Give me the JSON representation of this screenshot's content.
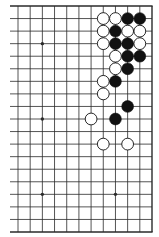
{
  "diagram": {
    "type": "go-board-fragment",
    "columns": 12,
    "rows": 19,
    "open_edges": [
      "left"
    ],
    "colors": {
      "line": "#2a2a2a",
      "black_stone": "#111111",
      "white_stone": "#ffffff",
      "background": "#ffffff"
    },
    "star_points": [
      {
        "col": 2,
        "row": 3
      },
      {
        "col": 2,
        "row": 9
      },
      {
        "col": 2,
        "row": 15
      },
      {
        "col": 8,
        "row": 15
      }
    ],
    "stones": [
      {
        "color": "white",
        "col": 7,
        "row": 1
      },
      {
        "color": "white",
        "col": 8,
        "row": 1
      },
      {
        "color": "black",
        "col": 9,
        "row": 1
      },
      {
        "color": "black",
        "col": 10,
        "row": 1
      },
      {
        "color": "white",
        "col": 7,
        "row": 2
      },
      {
        "color": "black",
        "col": 8,
        "row": 2
      },
      {
        "color": "white",
        "col": 9,
        "row": 2
      },
      {
        "color": "white",
        "col": 10,
        "row": 2
      },
      {
        "color": "white",
        "col": 7,
        "row": 3
      },
      {
        "color": "black",
        "col": 8,
        "row": 3
      },
      {
        "color": "black",
        "col": 9,
        "row": 3
      },
      {
        "color": "white",
        "col": 10,
        "row": 3
      },
      {
        "color": "white",
        "col": 8,
        "row": 4
      },
      {
        "color": "black",
        "col": 9,
        "row": 4
      },
      {
        "color": "black",
        "col": 10,
        "row": 4
      },
      {
        "color": "white",
        "col": 8,
        "row": 5
      },
      {
        "color": "black",
        "col": 9,
        "row": 5
      },
      {
        "color": "white",
        "col": 7,
        "row": 6
      },
      {
        "color": "black",
        "col": 8,
        "row": 6
      },
      {
        "color": "white",
        "col": 7,
        "row": 7
      },
      {
        "color": "black",
        "col": 9,
        "row": 8
      },
      {
        "color": "white",
        "col": 6,
        "row": 9
      },
      {
        "color": "black",
        "col": 8,
        "row": 9
      },
      {
        "color": "white",
        "col": 7,
        "row": 11
      },
      {
        "color": "white",
        "col": 9,
        "row": 11
      }
    ]
  }
}
